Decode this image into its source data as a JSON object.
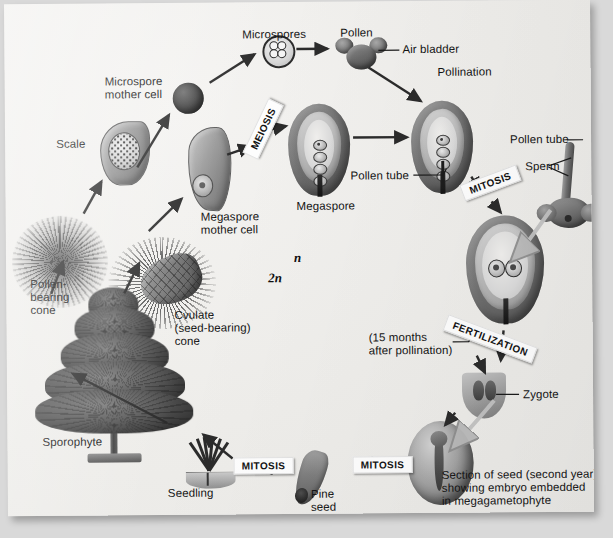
{
  "diagram": {
    "ploidy_labels": [
      {
        "id": "haploid",
        "text": "n"
      },
      {
        "id": "diploid",
        "text": "2n"
      }
    ],
    "stage_tags": [
      {
        "id": "meiosis",
        "label": "MEIOSIS"
      },
      {
        "id": "mitosis-pollen",
        "label": "MITOSIS"
      },
      {
        "id": "fertilization",
        "label": "FERTILIZATION"
      },
      {
        "id": "mitosis-seed",
        "label": "MITOSIS"
      },
      {
        "id": "mitosis-seedling",
        "label": "MITOSIS"
      }
    ],
    "labels": [
      {
        "id": "microspores",
        "text": "Microspores"
      },
      {
        "id": "pollen",
        "text": "Pollen"
      },
      {
        "id": "air-bladder",
        "text": "Air bladder"
      },
      {
        "id": "pollination",
        "text": "Pollination"
      },
      {
        "id": "pollen-tube-right",
        "text": "Pollen tube"
      },
      {
        "id": "sperm",
        "text": "Sperm"
      },
      {
        "id": "microspore-mother-cell",
        "text": "Microspore\nmother cell"
      },
      {
        "id": "scale",
        "text": "Scale"
      },
      {
        "id": "megaspore-mother-cell",
        "text": "Megaspore\nmother cell"
      },
      {
        "id": "megaspore",
        "text": "Megaspore"
      },
      {
        "id": "pollen-tube-center",
        "text": "Pollen tube"
      },
      {
        "id": "pollen-bearing-cone",
        "text": "Pollen-\nbearing\ncone"
      },
      {
        "id": "ovulate-cone",
        "text": "Cvulate\n(seed-bearing)\ncone"
      },
      {
        "id": "sporophyte",
        "text": "Sporophyte"
      },
      {
        "id": "months-after-pollination",
        "text": "(15 months\nafter pollination)"
      },
      {
        "id": "zygote",
        "text": "Zygote"
      },
      {
        "id": "seed-section",
        "text": "Section of seed (second year),\nshowing embryo embedded\nin megagametophyte"
      },
      {
        "id": "pine-seed",
        "text": "Pine\nseed"
      },
      {
        "id": "seedling",
        "text": "Seedling"
      }
    ],
    "colors": {
      "page": "#eeedea",
      "surround": "#d9d9d9",
      "ink": "#141414",
      "tag_bg": "#fdfdfd",
      "structure_dark": "#4e4e4e",
      "structure_light": "#c6c6c6"
    }
  }
}
